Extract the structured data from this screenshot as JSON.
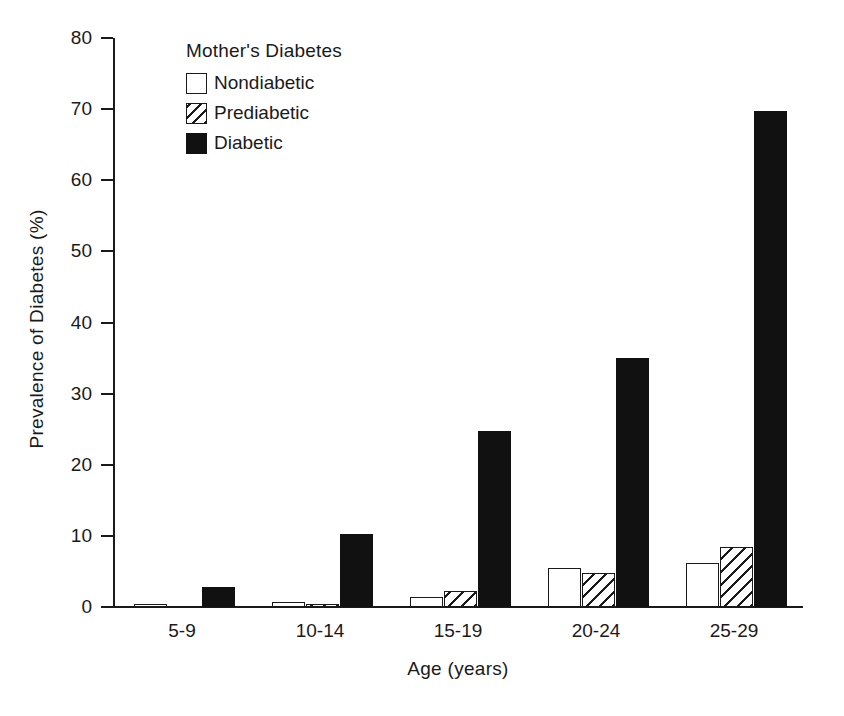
{
  "chart_data": {
    "type": "bar",
    "title": "",
    "xlabel": "Age (years)",
    "ylabel": "Prevalence of Diabetes (%)",
    "categories": [
      "5-9",
      "10-14",
      "15-19",
      "20-24",
      "25-29"
    ],
    "ylim": [
      0,
      80
    ],
    "yticks": [
      0,
      10,
      20,
      30,
      40,
      50,
      60,
      70,
      80
    ],
    "ytick_labels": [
      "0",
      "10",
      "20",
      "30",
      "40",
      "50",
      "60",
      "70",
      "80"
    ],
    "grid": false,
    "legend_position": "upper-left-inside",
    "legend_title": "Mother's Diabetes",
    "series": [
      {
        "name": "Nondiabetic",
        "fill": "white",
        "color": "#ffffff",
        "values": [
          0.3,
          0.7,
          1.4,
          5.5,
          6.2
        ]
      },
      {
        "name": "Prediabetic",
        "fill": "hatched",
        "color": "#ffffff",
        "values": [
          0.0,
          0.2,
          2.3,
          4.8,
          8.5
        ]
      },
      {
        "name": "Diabetic",
        "fill": "solid",
        "color": "#111111",
        "values": [
          2.8,
          10.2,
          24.8,
          35.0,
          69.8
        ]
      }
    ]
  }
}
